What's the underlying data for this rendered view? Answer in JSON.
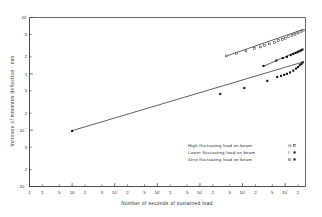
{
  "chart_data": {
    "type": "scatter",
    "title": "",
    "xlabel": "Number of seconds of sustained load",
    "ylabel": "Increase of minimum deflection - mm",
    "xscale": "log",
    "yscale": "log",
    "xlim": [
      1,
      3000000
    ],
    "ylim": [
      0.01,
      10
    ],
    "grid": false,
    "legend_position": "inside-lower-right",
    "x_tick_labels": [
      "1",
      "2",
      "5",
      "10",
      "2",
      "5",
      "10²",
      "2",
      "5",
      "10³",
      "2",
      "5",
      "10⁴",
      "2",
      "5",
      "10⁵",
      "2",
      "5",
      "10⁶",
      "2"
    ],
    "y_tick_labels": [
      "10¹",
      "5",
      "2",
      "10⁰",
      "5",
      "2",
      "1",
      "5",
      "2",
      "10⁻¹",
      "5",
      "2",
      "10⁻²"
    ],
    "series": [
      {
        "name": "High fluctuating load on beam G",
        "beam": "G",
        "marker": "open-square",
        "fit_x": [
          40000,
          2600000
        ],
        "fit_y": [
          2.05,
          6.1
        ],
        "points": [
          {
            "x": 42000,
            "y": 2.08
          },
          {
            "x": 72000,
            "y": 2.32
          },
          {
            "x": 120000,
            "y": 2.55
          },
          {
            "x": 190000,
            "y": 2.82
          },
          {
            "x": 260000,
            "y": 3.0
          },
          {
            "x": 330000,
            "y": 3.2
          },
          {
            "x": 430000,
            "y": 3.4
          },
          {
            "x": 560000,
            "y": 3.62
          },
          {
            "x": 700000,
            "y": 3.9
          },
          {
            "x": 860000,
            "y": 4.1
          },
          {
            "x": 1000000,
            "y": 4.3
          },
          {
            "x": 1200000,
            "y": 4.55
          },
          {
            "x": 1450000,
            "y": 4.8
          },
          {
            "x": 1700000,
            "y": 5.0
          },
          {
            "x": 2000000,
            "y": 5.3
          },
          {
            "x": 2350000,
            "y": 5.6
          },
          {
            "x": 2650000,
            "y": 5.95
          }
        ]
      },
      {
        "name": "Lower fluctuating load on beam I",
        "beam": "I",
        "marker": "filled-square",
        "fit_x": [
          300000,
          2600000
        ],
        "fit_y": [
          1.35,
          2.75
        ],
        "points": [
          {
            "x": 310000,
            "y": 1.38
          },
          {
            "x": 620000,
            "y": 1.72
          },
          {
            "x": 880000,
            "y": 1.9
          },
          {
            "x": 1100000,
            "y": 2.0
          },
          {
            "x": 1350000,
            "y": 2.15
          },
          {
            "x": 1550000,
            "y": 2.25
          },
          {
            "x": 1750000,
            "y": 2.35
          },
          {
            "x": 1950000,
            "y": 2.42
          },
          {
            "x": 2150000,
            "y": 2.52
          },
          {
            "x": 2350000,
            "y": 2.6
          },
          {
            "x": 2550000,
            "y": 2.7
          }
        ]
      },
      {
        "name": "Zero fluctuating load on beam B",
        "beam": "B",
        "marker": "filled-square",
        "fit_x": [
          10,
          2600000
        ],
        "fit_y": [
          0.098,
          1.62
        ],
        "points": [
          {
            "x": 10,
            "y": 0.097
          },
          {
            "x": 30000,
            "y": 0.44
          },
          {
            "x": 110000,
            "y": 0.56
          },
          {
            "x": 380000,
            "y": 0.75
          },
          {
            "x": 650000,
            "y": 0.88
          },
          {
            "x": 800000,
            "y": 0.92
          },
          {
            "x": 950000,
            "y": 0.96
          },
          {
            "x": 1100000,
            "y": 1.0
          },
          {
            "x": 1300000,
            "y": 1.06
          },
          {
            "x": 1550000,
            "y": 1.14
          },
          {
            "x": 1800000,
            "y": 1.24
          },
          {
            "x": 2000000,
            "y": 1.32
          },
          {
            "x": 2200000,
            "y": 1.42
          },
          {
            "x": 2400000,
            "y": 1.5
          },
          {
            "x": 2600000,
            "y": 1.6
          }
        ]
      }
    ]
  },
  "axes": {
    "x_title": "Number of seconds of sustained load",
    "y_title": "Increase of minimum deflection - mm"
  },
  "legend": {
    "entries": [
      {
        "label": "High fluctuating load on beam",
        "code": "G",
        "marker": "open-square"
      },
      {
        "label": "Lower fluctuating load on beam",
        "code": "I",
        "marker": "filled-square"
      },
      {
        "label": "Zero fluctuating load on beam",
        "code": "B",
        "marker": "filled-square"
      }
    ]
  },
  "colors": {
    "axis": "#3a3a3a",
    "marker": "#141414",
    "line": "#2b2b2b",
    "background": "#ffffff"
  }
}
